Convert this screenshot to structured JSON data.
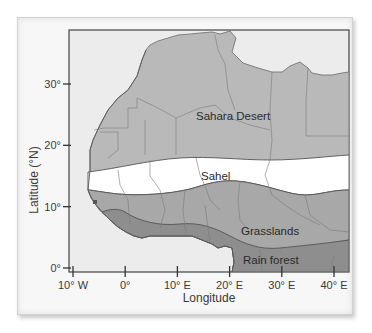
{
  "map": {
    "title": "",
    "x_axis": {
      "label": "Longitude",
      "ticks": [
        {
          "value": -10,
          "label": "10° W"
        },
        {
          "value": 0,
          "label": "0°"
        },
        {
          "value": 10,
          "label": "10° E"
        },
        {
          "value": 20,
          "label": "20° E"
        },
        {
          "value": 30,
          "label": "30° E"
        },
        {
          "value": 40,
          "label": "40° E"
        }
      ]
    },
    "y_axis": {
      "label": "Latitude (°N)",
      "ticks": [
        {
          "value": 0,
          "label": "0°"
        },
        {
          "value": 10,
          "label": "10°"
        },
        {
          "value": 20,
          "label": "20°"
        },
        {
          "value": 30,
          "label": "30°"
        }
      ]
    },
    "regions": [
      {
        "name": "Sahara Desert",
        "label": "Sahara Desert",
        "color": "#b9b9b9"
      },
      {
        "name": "Sahel",
        "label": "Sahel",
        "color": "#ffffff"
      },
      {
        "name": "Grasslands",
        "label": "Grasslands",
        "color": "#a8a8a8"
      },
      {
        "name": "Rain forest",
        "label": "Rain forest",
        "color": "#8e8e8e"
      }
    ],
    "colors": {
      "ocean": "#ececec",
      "border_line": "#7a7a7a",
      "axis": "#333333"
    }
  }
}
